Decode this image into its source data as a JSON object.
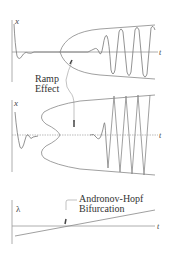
{
  "panels": {
    "top": {
      "y_label": "x",
      "x_label": "t"
    },
    "middle": {
      "y_label": "x",
      "x_label": "t"
    },
    "bottom": {
      "y_label": "λ",
      "x_label": "t"
    }
  },
  "annotations": {
    "ramp_effect_line1": "Ramp",
    "ramp_effect_line2": "Effect",
    "hopf_line1": "Andronov-Hopf",
    "hopf_line2": "Bifurcation"
  },
  "colors": {
    "axis": "#777777",
    "curve": "#888888",
    "text": "#333333"
  }
}
